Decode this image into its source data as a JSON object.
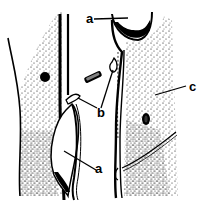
{
  "figure": {
    "type": "scientific-illustration",
    "style": "black-and-white stipple drawing of elongated cells with walls",
    "labels": [
      {
        "id": "a-top",
        "text": "a",
        "x": 86,
        "y": 12
      },
      {
        "id": "b",
        "text": "b",
        "x": 97,
        "y": 113
      },
      {
        "id": "c",
        "text": "c",
        "x": 189,
        "y": 80
      },
      {
        "id": "a-bottom",
        "text": "a",
        "x": 95,
        "y": 162
      }
    ],
    "caption": "",
    "colors": {
      "ink": "#000000",
      "paper": "#ffffff"
    }
  }
}
